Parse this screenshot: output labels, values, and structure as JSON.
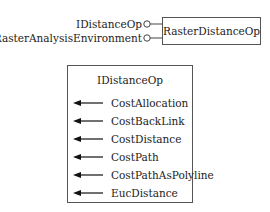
{
  "coclass": {
    "name": "RasterDistanceOp",
    "interfaces": [
      "IDistanceOp",
      "IRasterAnalysisEnvironment"
    ]
  },
  "interface_box": {
    "title": "IDistanceOp",
    "methods": [
      "CostAllocation",
      "CostBackLink",
      "CostDistance",
      "CostPath",
      "CostPathAsPolyline",
      "EucDistance"
    ]
  }
}
